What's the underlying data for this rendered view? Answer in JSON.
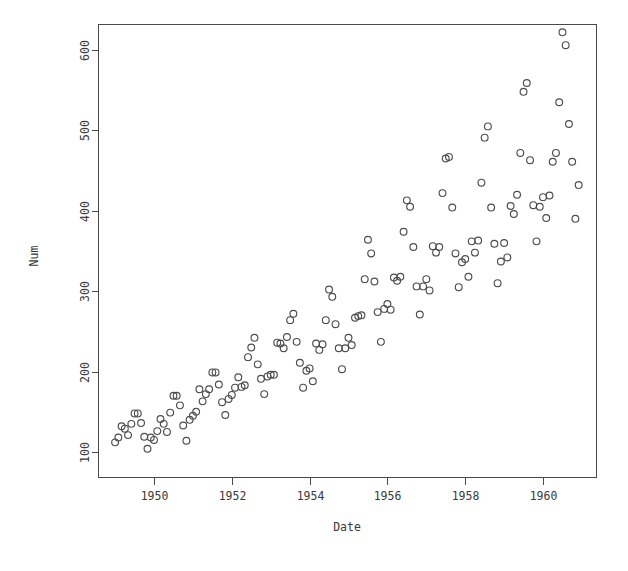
{
  "chart_data": {
    "type": "scatter",
    "title": "",
    "subtitle": "",
    "xlabel": "Date",
    "ylabel": "Num",
    "grid": false,
    "legend": null,
    "legend_position": "none",
    "marker": "open-circle",
    "marker_color": "#4d4d4d",
    "xlim": [
      1949.0,
      1960.917
    ],
    "ylim": [
      100,
      622
    ],
    "xticks": [
      1950,
      1952,
      1954,
      1956,
      1958,
      1960
    ],
    "xtick_labels": [
      "1950",
      "1952",
      "1954",
      "1956",
      "1958",
      "1960"
    ],
    "yticks": [
      100,
      200,
      300,
      400,
      500,
      600
    ],
    "ytick_labels": [
      "100",
      "200",
      "300",
      "400",
      "500",
      "600"
    ],
    "ytick_label_rotation": -90,
    "x": [
      1949.0,
      1949.083,
      1949.167,
      1949.25,
      1949.333,
      1949.417,
      1949.5,
      1949.583,
      1949.667,
      1949.75,
      1949.833,
      1949.917,
      1950.0,
      1950.083,
      1950.167,
      1950.25,
      1950.333,
      1950.417,
      1950.5,
      1950.583,
      1950.667,
      1950.75,
      1950.833,
      1950.917,
      1951.0,
      1951.083,
      1951.167,
      1951.25,
      1951.333,
      1951.417,
      1951.5,
      1951.583,
      1951.667,
      1951.75,
      1951.833,
      1951.917,
      1952.0,
      1952.083,
      1952.167,
      1952.25,
      1952.333,
      1952.417,
      1952.5,
      1952.583,
      1952.667,
      1952.75,
      1952.833,
      1952.917,
      1953.0,
      1953.083,
      1953.167,
      1953.25,
      1953.333,
      1953.417,
      1953.5,
      1953.583,
      1953.667,
      1953.75,
      1953.833,
      1953.917,
      1954.0,
      1954.083,
      1954.167,
      1954.25,
      1954.333,
      1954.417,
      1954.5,
      1954.583,
      1954.667,
      1954.75,
      1954.833,
      1954.917,
      1955.0,
      1955.083,
      1955.167,
      1955.25,
      1955.333,
      1955.417,
      1955.5,
      1955.583,
      1955.667,
      1955.75,
      1955.833,
      1955.917,
      1956.0,
      1956.083,
      1956.167,
      1956.25,
      1956.333,
      1956.417,
      1956.5,
      1956.583,
      1956.667,
      1956.75,
      1956.833,
      1956.917,
      1957.0,
      1957.083,
      1957.167,
      1957.25,
      1957.333,
      1957.417,
      1957.5,
      1957.583,
      1957.667,
      1957.75,
      1957.833,
      1957.917,
      1958.0,
      1958.083,
      1958.167,
      1958.25,
      1958.333,
      1958.417,
      1958.5,
      1958.583,
      1958.667,
      1958.75,
      1958.833,
      1958.917,
      1959.0,
      1959.083,
      1959.167,
      1959.25,
      1959.333,
      1959.417,
      1959.5,
      1959.583,
      1959.667,
      1959.75,
      1959.833,
      1959.917,
      1960.0,
      1960.083,
      1960.167,
      1960.25,
      1960.333,
      1960.417,
      1960.5,
      1960.583,
      1960.667,
      1960.75,
      1960.833,
      1960.917
    ],
    "y": [
      112,
      118,
      132,
      129,
      121,
      135,
      148,
      148,
      136,
      119,
      104,
      118,
      115,
      126,
      141,
      135,
      125,
      149,
      170,
      170,
      158,
      133,
      114,
      140,
      145,
      150,
      178,
      163,
      172,
      178,
      199,
      199,
      184,
      162,
      146,
      166,
      171,
      180,
      193,
      181,
      183,
      218,
      230,
      242,
      209,
      191,
      172,
      194,
      196,
      196,
      236,
      235,
      229,
      243,
      264,
      272,
      237,
      211,
      180,
      201,
      204,
      188,
      235,
      227,
      234,
      264,
      302,
      293,
      259,
      229,
      203,
      229,
      242,
      233,
      267,
      269,
      270,
      315,
      364,
      347,
      312,
      274,
      237,
      278,
      284,
      277,
      317,
      313,
      318,
      374,
      413,
      405,
      355,
      306,
      271,
      306,
      315,
      301,
      356,
      348,
      355,
      422,
      465,
      467,
      404,
      347,
      305,
      336,
      340,
      318,
      362,
      348,
      363,
      435,
      491,
      505,
      404,
      359,
      310,
      337,
      360,
      342,
      406,
      396,
      420,
      472,
      548,
      559,
      463,
      407,
      362,
      405,
      417,
      391,
      419,
      461,
      472,
      535,
      622,
      606,
      508,
      461,
      390,
      432
    ]
  },
  "axes": {
    "x_title": "Date",
    "y_title": "Num"
  }
}
